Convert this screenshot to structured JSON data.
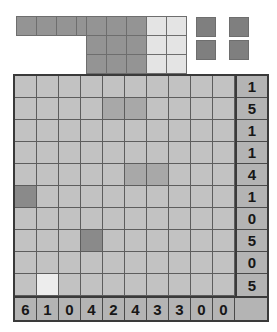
{
  "board": {
    "rows": 10,
    "cols": 10,
    "row_clues": [
      1,
      5,
      1,
      1,
      4,
      1,
      0,
      5,
      0,
      5
    ],
    "col_clues": [
      6,
      1,
      0,
      4,
      2,
      4,
      3,
      3,
      0,
      0
    ],
    "cells": [
      [
        0,
        0,
        0,
        0,
        0,
        0,
        0,
        0,
        0,
        0
      ],
      [
        0,
        0,
        0,
        0,
        1,
        1,
        0,
        0,
        0,
        0
      ],
      [
        0,
        0,
        0,
        0,
        0,
        0,
        0,
        0,
        0,
        0
      ],
      [
        0,
        0,
        0,
        0,
        0,
        0,
        0,
        0,
        0,
        0
      ],
      [
        0,
        0,
        0,
        0,
        0,
        1,
        1,
        0,
        0,
        0
      ],
      [
        2,
        0,
        0,
        0,
        0,
        0,
        0,
        0,
        0,
        0
      ],
      [
        0,
        0,
        0,
        0,
        0,
        0,
        0,
        0,
        0,
        0
      ],
      [
        0,
        0,
        0,
        2,
        0,
        0,
        0,
        0,
        0,
        0
      ],
      [
        0,
        0,
        0,
        0,
        0,
        0,
        0,
        0,
        0,
        0
      ],
      [
        0,
        3,
        0,
        0,
        0,
        0,
        0,
        0,
        0,
        0
      ]
    ],
    "colors": {
      "empty": "#c2c2c2",
      "shaded": "#a8a8a8",
      "dark": "#8a8a8a",
      "light": "#ededed",
      "clue_background": "#b4b4b4",
      "clue_text": "#171717",
      "border": "#3a3a3a",
      "gridline": "#5d5d5d"
    }
  },
  "pieces": [
    {
      "name": "horizontal-strip-1x4",
      "shape_rows": 1,
      "shape_cols": 4,
      "tone": "mid",
      "color": "#949494",
      "x": 17,
      "y": 17
    },
    {
      "name": "square-block-3x3",
      "shape_rows": 3,
      "shape_cols": 3,
      "tone": "mid",
      "color": "#949494",
      "x": 87,
      "y": 17
    },
    {
      "name": "rectangle-block-3x2",
      "shape_rows": 3,
      "shape_cols": 2,
      "tone": "light",
      "color": "#e4e4e4",
      "x": 147,
      "y": 17
    }
  ],
  "loose_squares": [
    {
      "name": "single-square-top-left",
      "x": 196,
      "y": 17,
      "color": "#7f7f7f"
    },
    {
      "name": "single-square-top-right",
      "x": 229,
      "y": 17,
      "color": "#7f7f7f"
    },
    {
      "name": "single-square-bottom-left",
      "x": 196,
      "y": 40,
      "color": "#7f7f7f"
    },
    {
      "name": "single-square-bottom-right",
      "x": 229,
      "y": 40,
      "color": "#7f7f7f"
    }
  ]
}
